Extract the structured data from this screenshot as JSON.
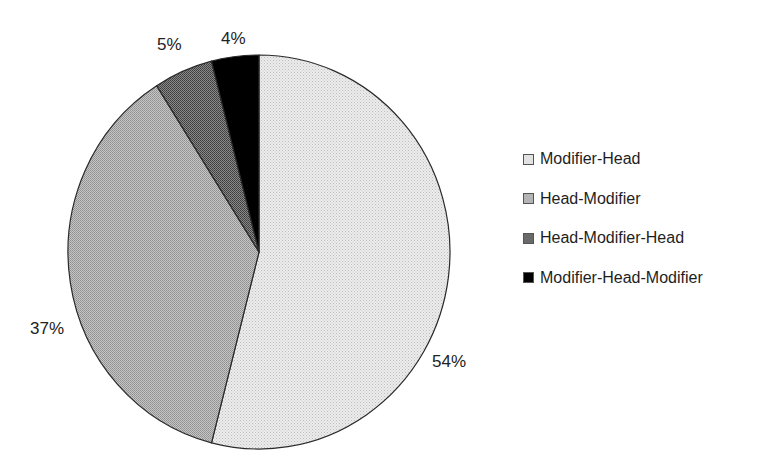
{
  "chart_data": {
    "type": "pie",
    "title": "",
    "categories": [
      "Modifier-Head",
      "Head-Modifier",
      "Head-Modifier-Head",
      "Modifier-Head-Modifier"
    ],
    "values": [
      54,
      37,
      5,
      4
    ],
    "unit": "%",
    "data_labels": [
      "54%",
      "37%",
      "5%",
      "4%"
    ],
    "start_angle_deg": 0,
    "direction": "clockwise-from-top",
    "legend_position": "right",
    "colors": [
      "#e2e2e2",
      "#b4b4b4",
      "#6a6a6a",
      "#000000"
    ],
    "patterns": [
      "light-dotted",
      "medium-dotted",
      "dark-dotted",
      "solid-black"
    ]
  },
  "legend": {
    "items": [
      {
        "label": "Modifier-Head",
        "color": "#e2e2e2"
      },
      {
        "label": "Head-Modifier",
        "color": "#b4b4b4"
      },
      {
        "label": "Head-Modifier-Head",
        "color": "#6a6a6a"
      },
      {
        "label": "Modifier-Head-Modifier",
        "color": "#000000"
      }
    ]
  },
  "labels": {
    "modifier_head": "54%",
    "head_modifier": "37%",
    "head_modifier_head": "5%",
    "modifier_head_modifier": "4%"
  }
}
